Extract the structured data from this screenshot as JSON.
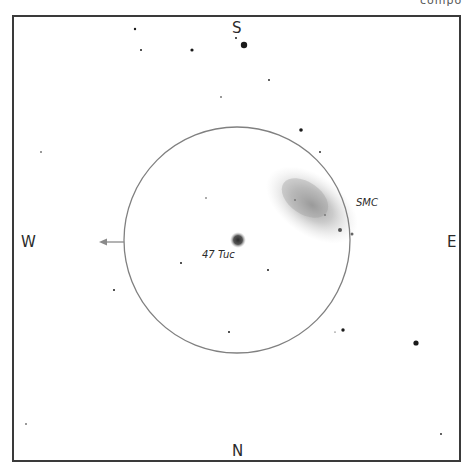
{
  "header": {
    "partial_text": "compo"
  },
  "chart": {
    "field_circle": {
      "cx": 237,
      "cy": 240,
      "r": 113,
      "color": "#808080"
    },
    "directions": {
      "north": "N",
      "south": "S",
      "east": "E",
      "west": "W"
    },
    "motion_arrow": {
      "from_x": 124,
      "to_x": 100,
      "y": 242,
      "color": "#8a8a8a"
    },
    "objects": [
      {
        "name": "47 Tuc",
        "label": "47 Tuc",
        "type": "globular-cluster",
        "x": 238,
        "y": 240
      },
      {
        "name": "SMC",
        "label": "SMC",
        "type": "galaxy",
        "x": 310,
        "y": 205
      }
    ],
    "stars": [
      {
        "x": 244,
        "y": 45,
        "r": 3.2
      },
      {
        "x": 192,
        "y": 50,
        "r": 1.6
      },
      {
        "x": 135,
        "y": 29,
        "r": 1.2
      },
      {
        "x": 141,
        "y": 50,
        "r": 1.0
      },
      {
        "x": 236,
        "y": 38,
        "r": 1.0
      },
      {
        "x": 269,
        "y": 80,
        "r": 0.9
      },
      {
        "x": 221,
        "y": 97,
        "r": 0.8
      },
      {
        "x": 301,
        "y": 130,
        "r": 1.8
      },
      {
        "x": 320,
        "y": 152,
        "r": 0.9
      },
      {
        "x": 41,
        "y": 152,
        "r": 0.8
      },
      {
        "x": 181,
        "y": 263,
        "r": 1.0
      },
      {
        "x": 268,
        "y": 270,
        "r": 1.0
      },
      {
        "x": 114,
        "y": 290,
        "r": 1.0
      },
      {
        "x": 229,
        "y": 332,
        "r": 1.0
      },
      {
        "x": 343,
        "y": 330,
        "r": 1.7
      },
      {
        "x": 335,
        "y": 332,
        "r": 0.6
      },
      {
        "x": 416,
        "y": 343,
        "r": 2.6
      },
      {
        "x": 206,
        "y": 198,
        "r": 0.7
      },
      {
        "x": 26,
        "y": 424,
        "r": 0.8
      },
      {
        "x": 441,
        "y": 434,
        "r": 0.9
      }
    ]
  }
}
